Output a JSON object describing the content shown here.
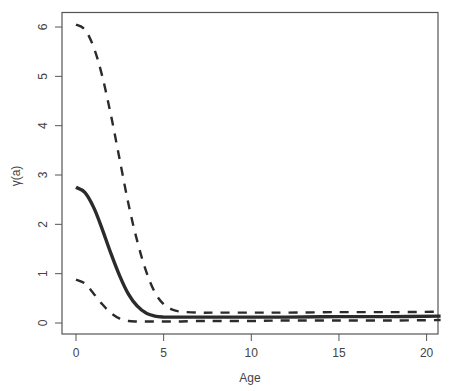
{
  "chart_data": {
    "type": "line",
    "title": "",
    "xlabel": "Age",
    "ylabel": "γ(a)",
    "xlim": [
      -0.8,
      20.8
    ],
    "ylim": [
      -0.22,
      6.3
    ],
    "grid": false,
    "legend": null,
    "x_ticks": [
      0,
      5,
      10,
      15,
      20
    ],
    "x_tick_labels": [
      "0",
      "5",
      "10",
      "15",
      "20"
    ],
    "y_ticks": [
      0,
      1,
      2,
      3,
      4,
      5,
      6
    ],
    "y_tick_labels": [
      "0",
      "1",
      "2",
      "3",
      "4",
      "5",
      "6"
    ],
    "x": [
      0,
      0.5,
      1,
      1.5,
      2,
      2.5,
      3,
      3.5,
      4,
      4.5,
      5,
      5.5,
      6,
      7,
      8,
      10,
      12,
      15,
      18,
      20.8
    ],
    "series": [
      {
        "name": "upper bound",
        "style": "dashed",
        "values": [
          6.05,
          5.95,
          5.6,
          5.0,
          4.2,
          3.3,
          2.4,
          1.65,
          1.05,
          0.62,
          0.38,
          0.27,
          0.23,
          0.21,
          0.21,
          0.21,
          0.21,
          0.22,
          0.22,
          0.23
        ]
      },
      {
        "name": "estimate",
        "style": "solid",
        "values": [
          2.75,
          2.65,
          2.35,
          1.9,
          1.4,
          0.95,
          0.58,
          0.34,
          0.2,
          0.14,
          0.12,
          0.12,
          0.12,
          0.12,
          0.12,
          0.12,
          0.12,
          0.13,
          0.13,
          0.14
        ]
      },
      {
        "name": "lower bound",
        "style": "dashed",
        "values": [
          0.88,
          0.8,
          0.6,
          0.38,
          0.2,
          0.09,
          0.04,
          0.03,
          0.03,
          0.03,
          0.03,
          0.03,
          0.03,
          0.04,
          0.04,
          0.04,
          0.05,
          0.05,
          0.05,
          0.06
        ]
      }
    ]
  }
}
